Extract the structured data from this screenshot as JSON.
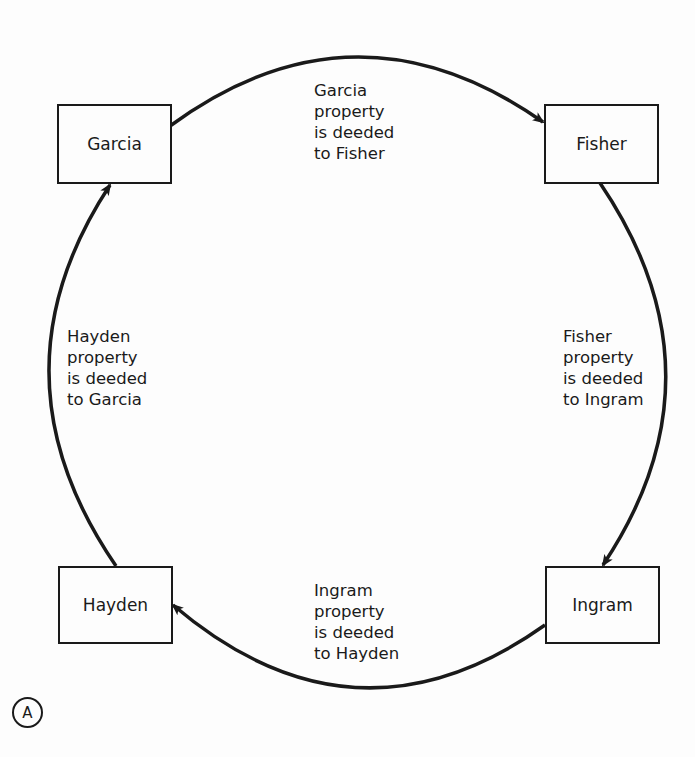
{
  "diagram": {
    "nodes": [
      {
        "id": "garcia",
        "label": "Garcia"
      },
      {
        "id": "fisher",
        "label": "Fisher"
      },
      {
        "id": "ingram",
        "label": "Ingram"
      },
      {
        "id": "hayden",
        "label": "Hayden"
      }
    ],
    "edges": [
      {
        "from": "garcia",
        "to": "fisher",
        "lines": [
          "Garcia",
          "property",
          "is deeded",
          "to Fisher"
        ]
      },
      {
        "from": "fisher",
        "to": "ingram",
        "lines": [
          "Fisher",
          "property",
          "is deeded",
          "to Ingram"
        ]
      },
      {
        "from": "ingram",
        "to": "hayden",
        "lines": [
          "Ingram",
          "property",
          "is deeded",
          "to Hayden"
        ]
      },
      {
        "from": "hayden",
        "to": "garcia",
        "lines": [
          "Hayden",
          "property",
          "is deeded",
          "to Garcia"
        ]
      }
    ],
    "marker": "A",
    "colors": {
      "stroke": "#1a1a1a",
      "background": "#fdfdfd"
    }
  }
}
